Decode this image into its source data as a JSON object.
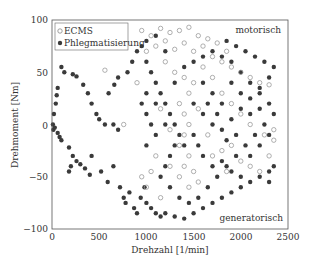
{
  "chart_data": {
    "type": "scatter",
    "title": "",
    "xlabel": "Drehzahl [1/min]",
    "ylabel": "Drehmoment [Nm]",
    "xlim": [
      0,
      2500
    ],
    "ylim": [
      -100,
      100
    ],
    "xticks": [
      0,
      500,
      1000,
      1500,
      2000,
      2500
    ],
    "yticks": [
      -100,
      -50,
      0,
      50,
      100
    ],
    "grid": false,
    "legend_position": "upper left",
    "annotations": [
      {
        "text": "motorisch",
        "x": 2150,
        "y": 88
      },
      {
        "text": "generatorisch",
        "x": 2150,
        "y": -88
      }
    ],
    "series": [
      {
        "name": "ECMS",
        "marker": "open-circle",
        "color": "#9a9a9a",
        "points": [
          [
            950,
            90
          ],
          [
            1050,
            85
          ],
          [
            1150,
            92
          ],
          [
            1250,
            88
          ],
          [
            1350,
            90
          ],
          [
            1450,
            93
          ],
          [
            1550,
            85
          ],
          [
            1650,
            82
          ],
          [
            1750,
            78
          ],
          [
            1850,
            70
          ],
          [
            1000,
            70
          ],
          [
            1100,
            75
          ],
          [
            1200,
            80
          ],
          [
            1300,
            72
          ],
          [
            1400,
            78
          ],
          [
            1500,
            70
          ],
          [
            1600,
            75
          ],
          [
            1700,
            65
          ],
          [
            1800,
            60
          ],
          [
            1900,
            55
          ],
          [
            2000,
            50
          ],
          [
            2100,
            45
          ],
          [
            2200,
            40
          ],
          [
            2300,
            38
          ],
          [
            1300,
            50
          ],
          [
            1400,
            45
          ],
          [
            1500,
            40
          ],
          [
            1450,
            30
          ],
          [
            1350,
            20
          ],
          [
            1400,
            10
          ],
          [
            1450,
            0
          ],
          [
            1400,
            -10
          ],
          [
            1350,
            -20
          ],
          [
            1450,
            -30
          ],
          [
            1400,
            -40
          ],
          [
            1500,
            -45
          ],
          [
            1550,
            -55
          ],
          [
            1450,
            -60
          ],
          [
            1350,
            -50
          ],
          [
            1250,
            -40
          ],
          [
            1100,
            -30
          ],
          [
            1050,
            -45
          ],
          [
            950,
            -50
          ],
          [
            1000,
            -60
          ],
          [
            1150,
            -70
          ],
          [
            1700,
            -30
          ],
          [
            1800,
            -25
          ],
          [
            1900,
            -20
          ],
          [
            2000,
            -35
          ],
          [
            2100,
            -40
          ],
          [
            2200,
            -45
          ],
          [
            2300,
            -30
          ],
          [
            2350,
            -15
          ],
          [
            2250,
            -10
          ],
          [
            2100,
            0
          ],
          [
            2000,
            10
          ],
          [
            1900,
            20
          ],
          [
            1800,
            30
          ],
          [
            560,
            52
          ],
          [
            760,
            0
          ],
          [
            900,
            40
          ],
          [
            1200,
            60
          ],
          [
            1600,
            55
          ],
          [
            1700,
            45
          ],
          [
            1150,
            15
          ],
          [
            1250,
            -5
          ],
          [
            1550,
            15
          ],
          [
            1650,
            -10
          ],
          [
            1850,
            -45
          ],
          [
            2350,
            -5
          ]
        ]
      },
      {
        "name": "Phlegmatisierung",
        "marker": "filled-circle",
        "color": "#3a3a3a",
        "points": [
          [
            100,
            55
          ],
          [
            130,
            50
          ],
          [
            60,
            35
          ],
          [
            50,
            28
          ],
          [
            40,
            20
          ],
          [
            20,
            10
          ],
          [
            10,
            0
          ],
          [
            15,
            -5
          ],
          [
            30,
            -3
          ],
          [
            60,
            -8
          ],
          [
            80,
            -12
          ],
          [
            100,
            -15
          ],
          [
            180,
            -22
          ],
          [
            220,
            -30
          ],
          [
            260,
            -35
          ],
          [
            200,
            -40
          ],
          [
            180,
            -45
          ],
          [
            300,
            -38
          ],
          [
            350,
            -42
          ],
          [
            400,
            -48
          ],
          [
            420,
            -30
          ],
          [
            520,
            -45
          ],
          [
            590,
            -55
          ],
          [
            650,
            -40
          ],
          [
            720,
            -60
          ],
          [
            760,
            -70
          ],
          [
            780,
            -75
          ],
          [
            820,
            -65
          ],
          [
            870,
            -80
          ],
          [
            900,
            -85
          ],
          [
            940,
            -70
          ],
          [
            980,
            -60
          ],
          [
            1000,
            -75
          ],
          [
            1050,
            -80
          ],
          [
            1100,
            -85
          ],
          [
            1150,
            -88
          ],
          [
            1200,
            -85
          ],
          [
            1300,
            -88
          ],
          [
            1400,
            -90
          ],
          [
            1500,
            -85
          ],
          [
            1600,
            -80
          ],
          [
            1700,
            -75
          ],
          [
            1800,
            -70
          ],
          [
            1900,
            -65
          ],
          [
            2000,
            -60
          ],
          [
            2100,
            -55
          ],
          [
            2200,
            -50
          ],
          [
            2300,
            -45
          ],
          [
            2350,
            -40
          ],
          [
            2300,
            -55
          ],
          [
            220,
            48
          ],
          [
            260,
            46
          ],
          [
            330,
            38
          ],
          [
            380,
            30
          ],
          [
            420,
            20
          ],
          [
            470,
            10
          ],
          [
            500,
            5
          ],
          [
            560,
            0
          ],
          [
            650,
            0
          ],
          [
            700,
            -5
          ],
          [
            600,
            30
          ],
          [
            660,
            38
          ],
          [
            700,
            45
          ],
          [
            800,
            50
          ],
          [
            850,
            60
          ],
          [
            900,
            70
          ],
          [
            950,
            75
          ],
          [
            1000,
            80
          ],
          [
            1100,
            85
          ],
          [
            1200,
            70
          ],
          [
            1000,
            60
          ],
          [
            1050,
            50
          ],
          [
            1100,
            40
          ],
          [
            1150,
            30
          ],
          [
            1200,
            20
          ],
          [
            1250,
            10
          ],
          [
            1300,
            0
          ],
          [
            1350,
            -10
          ],
          [
            1300,
            -20
          ],
          [
            1250,
            -30
          ],
          [
            1200,
            -40
          ],
          [
            1150,
            -50
          ],
          [
            1250,
            -60
          ],
          [
            1350,
            -70
          ],
          [
            1450,
            -75
          ],
          [
            1550,
            -70
          ],
          [
            1650,
            -60
          ],
          [
            1750,
            -50
          ],
          [
            1850,
            -40
          ],
          [
            1950,
            -30
          ],
          [
            2050,
            -20
          ],
          [
            2150,
            -10
          ],
          [
            2250,
            0
          ],
          [
            2350,
            10
          ],
          [
            2300,
            20
          ],
          [
            2200,
            30
          ],
          [
            2100,
            40
          ],
          [
            2000,
            50
          ],
          [
            1900,
            60
          ],
          [
            1800,
            65
          ],
          [
            1700,
            70
          ],
          [
            1600,
            65
          ],
          [
            1500,
            60
          ],
          [
            1400,
            55
          ],
          [
            1300,
            40
          ],
          [
            1500,
            20
          ],
          [
            1600,
            10
          ],
          [
            1700,
            0
          ],
          [
            1800,
            -5
          ],
          [
            1900,
            5
          ],
          [
            2000,
            15
          ],
          [
            2100,
            25
          ],
          [
            2200,
            35
          ],
          [
            2300,
            45
          ],
          [
            2350,
            55
          ],
          [
            2250,
            60
          ],
          [
            2150,
            65
          ],
          [
            2050,
            70
          ],
          [
            1950,
            75
          ],
          [
            1850,
            80
          ],
          [
            1000,
            10
          ],
          [
            1050,
            0
          ],
          [
            1100,
            -10
          ],
          [
            1000,
            -20
          ],
          [
            950,
            20
          ],
          [
            1000,
            30
          ],
          [
            1100,
            20
          ],
          [
            1200,
            0
          ],
          [
            1400,
            -20
          ],
          [
            1600,
            -30
          ],
          [
            1700,
            -40
          ],
          [
            1800,
            -35
          ],
          [
            1900,
            -45
          ],
          [
            2000,
            -50
          ],
          [
            2100,
            -30
          ],
          [
            2200,
            -20
          ],
          [
            2300,
            -10
          ],
          [
            1600,
            40
          ],
          [
            1700,
            30
          ],
          [
            1800,
            20
          ],
          [
            1900,
            40
          ],
          [
            2000,
            30
          ],
          [
            2100,
            10
          ],
          [
            2200,
            15
          ],
          [
            1500,
            -10
          ],
          [
            1550,
            -20
          ],
          [
            1650,
            20
          ],
          [
            1750,
            10
          ],
          [
            1850,
            -15
          ],
          [
            1950,
            -10
          ]
        ]
      }
    ]
  },
  "plot": {
    "legend": {
      "ecms": "ECMS",
      "phleg": "Phlegmatisierung"
    },
    "ann_motorisch": "motorisch",
    "ann_generatorisch": "generatorisch",
    "xlabel": "Drehzahl [1/min]",
    "ylabel": "Drehmoment [Nm]",
    "xticks": [
      "0",
      "500",
      "1000",
      "1500",
      "2000",
      "2500"
    ],
    "yticks": [
      "100",
      "50",
      "0",
      "−50",
      "−100"
    ]
  }
}
